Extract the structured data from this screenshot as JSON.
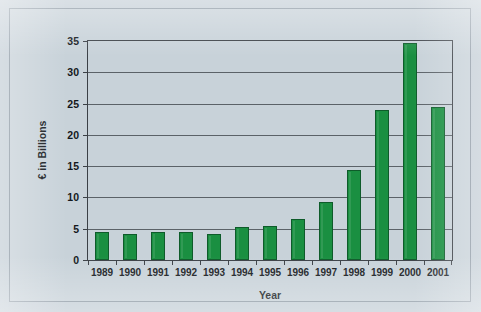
{
  "chart_data": {
    "type": "bar",
    "title": "",
    "xlabel": "Year",
    "ylabel": "€ in Billions",
    "categories": [
      "1989",
      "1990",
      "1991",
      "1992",
      "1993",
      "1994",
      "1995",
      "1996",
      "1997",
      "1998",
      "1999",
      "2000",
      "2001"
    ],
    "values": [
      4.4,
      4.2,
      4.5,
      4.5,
      4.2,
      5.2,
      5.4,
      6.5,
      9.3,
      14.4,
      24.0,
      34.7,
      24.4
    ],
    "series": [
      {
        "name": "€ in Billions",
        "values": [
          4.4,
          4.2,
          4.5,
          4.5,
          4.2,
          5.2,
          5.4,
          6.5,
          9.3,
          14.4,
          24.0,
          34.7,
          24.4
        ]
      }
    ],
    "ylim": [
      0,
      35
    ],
    "yticks": [
      0,
      5,
      10,
      15,
      20,
      25,
      30,
      35
    ],
    "ytick_labels": [
      "0",
      "5",
      "10",
      "15",
      "20",
      "25",
      "30",
      "35"
    ],
    "grid": true,
    "legend": false,
    "legend_position": "none",
    "bar_color": "#1a8f41",
    "bar_edge_color": "#0e5b2a",
    "background_color": "#c8d2d9",
    "axis_color": "#3b4046",
    "gridline_color": "#5b6268"
  }
}
